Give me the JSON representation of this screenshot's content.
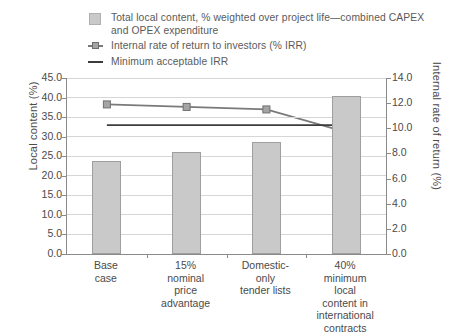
{
  "legend": [
    {
      "marker": "bar-swatch",
      "label": "Total local content, % weighted over project life—combined CAPEX and OPEX expenditure"
    },
    {
      "marker": "line-marker-swatch",
      "label": "Internal rate of return to investors (% IRR)"
    },
    {
      "marker": "plain-line-swatch",
      "label": "Minimum acceptable IRR"
    }
  ],
  "chart_data": {
    "type": "bar",
    "title": "",
    "categories": [
      "Base case",
      "15% nominal price advantage",
      "Domestic-only tender lists",
      "40% minimum local content in international contracts"
    ],
    "category_lines": [
      [
        "Base",
        "case"
      ],
      [
        "15%",
        "nominal",
        "price",
        "advantage"
      ],
      [
        "Domestic-",
        "only",
        "tender lists"
      ],
      [
        "40%",
        "minimum",
        "local",
        "content in",
        "international",
        "contracts"
      ]
    ],
    "series": [
      {
        "name": "Total local content, % weighted over project life—combined CAPEX and OPEX expenditure",
        "type": "bar",
        "axis": "left",
        "color": "#c9c9c9",
        "values": [
          23.7,
          26.0,
          28.7,
          40.5
        ]
      },
      {
        "name": "Internal rate of return to investors (% IRR)",
        "type": "line",
        "axis": "right",
        "color": "#7a7a7a",
        "values": [
          11.9,
          11.7,
          11.5,
          9.7
        ]
      },
      {
        "name": "Minimum acceptable IRR",
        "type": "line",
        "axis": "right",
        "color": "#3c3c3c",
        "values": [
          10.25,
          10.25,
          10.25,
          10.25
        ]
      }
    ],
    "xlabel": "",
    "ylabel": "Local content (%)",
    "ylabel_right": "Internal rate of return (%)",
    "ylim": [
      0.0,
      45.0
    ],
    "ylim_right": [
      0.0,
      14.0
    ],
    "yticks": [
      "0.0",
      "5.0",
      "10.0",
      "15.0",
      "20.0",
      "25.0",
      "30.0",
      "35.0",
      "40.0",
      "45.0"
    ],
    "yticks_right": [
      "0.0",
      "2.0",
      "4.0",
      "6.0",
      "8.0",
      "10.0",
      "12.0",
      "14.0"
    ],
    "grid": true,
    "legend_position": "top-left"
  }
}
